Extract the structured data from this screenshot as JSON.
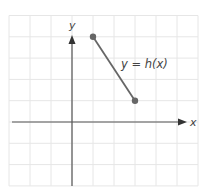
{
  "chart_data": {
    "type": "line",
    "title": "",
    "xlabel": "x",
    "ylabel": "y",
    "xlim": [
      -3,
      6
    ],
    "ylim": [
      -3,
      5
    ],
    "grid": true,
    "series": [
      {
        "name": "y = h(x)",
        "points": [
          [
            1,
            4
          ],
          [
            3,
            1
          ]
        ],
        "endpoints": "closed-dots"
      }
    ],
    "annotations": [
      {
        "text": "y = h(x)",
        "x": 2.3,
        "y": 3
      }
    ],
    "tick_labels": "none"
  },
  "labels": {
    "x_axis": "x",
    "y_axis": "y",
    "function": "y = h(x)"
  },
  "colors": {
    "grid": "#e6e6e6",
    "axis": "#555555",
    "line": "#666666",
    "point": "#666666"
  }
}
